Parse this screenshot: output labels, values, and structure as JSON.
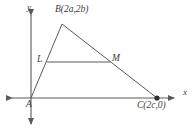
{
  "figure": {
    "background_color": "#ffffff",
    "line_color": "#5a5a5a",
    "text_color": "#3b3b3b",
    "axes": {
      "x_label": "x",
      "y_label": "y",
      "origin_label": "A",
      "x_axis_y_pixel": 98,
      "y_axis_x_pixel": 31,
      "x_arrow_left_tip": 5,
      "x_arrow_right_tip": 180,
      "y_arrow_top_tip": 8,
      "y_arrow_bottom_tip": 130
    },
    "points": [
      {
        "name": "A",
        "label": "A",
        "x": 31,
        "y": 98,
        "marker": false
      },
      {
        "name": "B",
        "label": "B(2a,2b)",
        "x": 62,
        "y": 24,
        "marker": false
      },
      {
        "name": "C",
        "label": "C(2c,0)",
        "x": 157,
        "y": 98,
        "marker": true
      },
      {
        "name": "L",
        "label": "L",
        "x": 47,
        "y": 62,
        "marker": false
      },
      {
        "name": "M",
        "label": "M",
        "x": 110,
        "y": 62,
        "marker": false
      }
    ],
    "segments": [
      {
        "name": "segment-AB",
        "from": "A",
        "to": "B"
      },
      {
        "name": "segment-BC",
        "from": "B",
        "to": "C"
      },
      {
        "name": "segment-LM",
        "from": "L",
        "to": "M"
      }
    ],
    "labels": {
      "vertex_b": "B(2a,2b)",
      "vertex_c": "C(2c,0)",
      "vertex_a": "A",
      "midpoint_l": "L",
      "midpoint_m": "M",
      "axis_x": "x",
      "axis_y": "y"
    }
  }
}
